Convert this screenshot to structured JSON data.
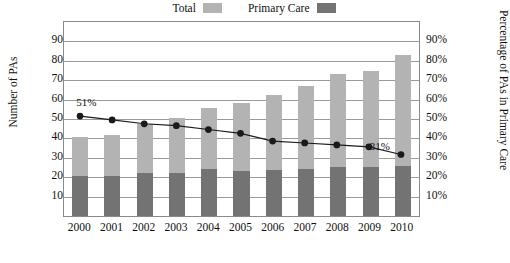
{
  "legend": {
    "items": [
      {
        "label": "Total",
        "color": "#b3b3b3"
      },
      {
        "label": "Primary Care",
        "color": "#737373"
      }
    ]
  },
  "axes": {
    "y_left": {
      "title": "Number of PAs",
      "ticks": [
        "10,000",
        "20,000",
        "30,000",
        "40,000",
        "50,000",
        "60,000",
        "70,000",
        "80,000",
        "90,000"
      ],
      "min": 0,
      "max": 100000
    },
    "y_right": {
      "title": "Percentage of PAs in Primary Care",
      "ticks": [
        "10%",
        "20%",
        "30%",
        "40%",
        "50%",
        "60%",
        "70%",
        "80%",
        "90%"
      ],
      "min": 0,
      "max": 100
    },
    "x": {
      "ticks": [
        "2000",
        "2001",
        "2002",
        "2003",
        "2004",
        "2005",
        "2006",
        "2007",
        "2008",
        "2009",
        "2010"
      ]
    }
  },
  "annotations": [
    {
      "text": "51%",
      "year": "2000"
    },
    {
      "text": "31%",
      "year": "2010"
    }
  ],
  "chart_data": {
    "type": "bar",
    "title": "",
    "subtitle": "",
    "xlabel": "",
    "ylabel": "Number of PAs",
    "y2label": "Percentage of PAs in Primary Care",
    "categories": [
      "2000",
      "2001",
      "2002",
      "2003",
      "2004",
      "2005",
      "2006",
      "2007",
      "2008",
      "2009",
      "2010"
    ],
    "ylim": [
      0,
      100000
    ],
    "y2lim": [
      0,
      100
    ],
    "grid": true,
    "legend_position": "top-center",
    "stacked": true,
    "series": [
      {
        "name": "Total",
        "type": "bar",
        "axis": "left",
        "color": "#b3b3b3",
        "values": [
          40500,
          42000,
          47500,
          50500,
          55500,
          58500,
          62500,
          67000,
          73000,
          74500,
          83000
        ]
      },
      {
        "name": "Primary Care",
        "type": "bar",
        "axis": "left",
        "color": "#737373",
        "values": [
          20700,
          20800,
          22000,
          22300,
          24200,
          23000,
          23500,
          24200,
          25500,
          25200,
          25700
        ]
      },
      {
        "name": "Percentage of PAs in Primary Care",
        "type": "line",
        "axis": "right",
        "color": "#1a1a1a",
        "values": [
          51,
          49,
          47,
          46,
          44,
          42,
          38,
          37,
          36,
          35,
          31
        ]
      }
    ]
  }
}
